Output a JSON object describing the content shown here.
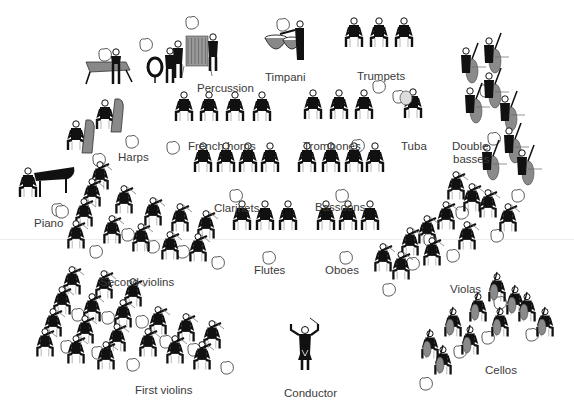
{
  "colors": {
    "figure": "#111111",
    "instrument_gray": "#8a8a8a",
    "label": "#3a3a3a",
    "background": "#ffffff",
    "outline": "#333333"
  },
  "sections": [
    {
      "id": "percussion",
      "label": "Percussion",
      "x": 197,
      "y": 82,
      "players": [
        {
          "x": 108,
          "y": 58,
          "kind": "xylophone"
        },
        {
          "x": 148,
          "y": 43,
          "kind": "bassdrum"
        },
        {
          "x": 178,
          "y": 44,
          "kind": "standing"
        },
        {
          "x": 190,
          "y": 36,
          "kind": "chimes"
        },
        {
          "x": 213,
          "y": 37,
          "kind": "standing"
        }
      ],
      "bubbles": [
        [
          105,
          55
        ],
        [
          146,
          45
        ],
        [
          192,
          23
        ]
      ]
    },
    {
      "id": "timpani",
      "label": "Timpani",
      "x": 265,
      "y": 71,
      "players": [
        {
          "x": 290,
          "y": 30,
          "kind": "timpani"
        }
      ],
      "bubbles": [
        [
          283,
          25
        ]
      ]
    },
    {
      "id": "trumpets",
      "label": "Trumpets",
      "x": 357,
      "y": 70,
      "players": [
        {
          "x": 354,
          "y": 35
        },
        {
          "x": 379,
          "y": 35
        },
        {
          "x": 404,
          "y": 35
        }
      ],
      "bubbles": [
        [
          379,
          87
        ]
      ]
    },
    {
      "id": "french_horns",
      "label": "French horns",
      "x": 188,
      "y": 140,
      "players": [
        {
          "x": 184,
          "y": 109
        },
        {
          "x": 209,
          "y": 109
        },
        {
          "x": 235,
          "y": 109
        },
        {
          "x": 262,
          "y": 109
        }
      ],
      "bubbles": [
        [
          173,
          148
        ]
      ]
    },
    {
      "id": "harps",
      "label": "Harps",
      "x": 118,
      "y": 151,
      "players": [
        {
          "x": 82,
          "y": 128,
          "kind": "harp"
        },
        {
          "x": 111,
          "y": 107,
          "kind": "harp"
        }
      ],
      "bubbles": [
        [
          99,
          160
        ],
        [
          132,
          142
        ]
      ]
    },
    {
      "id": "trombones",
      "label": "Trombones",
      "x": 303,
      "y": 140,
      "players": [
        {
          "x": 313,
          "y": 107
        },
        {
          "x": 339,
          "y": 107
        },
        {
          "x": 364,
          "y": 107
        }
      ],
      "bubbles": [
        [
          358,
          146
        ]
      ]
    },
    {
      "id": "tuba",
      "label": "Tuba",
      "x": 401,
      "y": 140,
      "players": [
        {
          "x": 413,
          "y": 106,
          "kind": "tuba"
        }
      ],
      "bubbles": [
        [
          399,
          97
        ]
      ]
    },
    {
      "id": "double_basses",
      "label_line1": "Double",
      "label_line2": "basses",
      "x": 452,
      "y": 140,
      "players": [
        {
          "x": 474,
          "y": 65,
          "kind": "bass"
        },
        {
          "x": 497,
          "y": 55,
          "kind": "bass"
        },
        {
          "x": 497,
          "y": 90,
          "kind": "bass"
        },
        {
          "x": 478,
          "y": 105,
          "kind": "bass"
        },
        {
          "x": 513,
          "y": 113,
          "kind": "bass"
        },
        {
          "x": 517,
          "y": 145,
          "kind": "bass"
        },
        {
          "x": 495,
          "y": 162,
          "kind": "bass"
        },
        {
          "x": 530,
          "y": 167,
          "kind": "bass"
        }
      ],
      "bubbles": [
        [
          486,
          91
        ],
        [
          494,
          139
        ],
        [
          518,
          196
        ]
      ]
    },
    {
      "id": "clarinets",
      "label": "Clarinets",
      "x": 214,
      "y": 202,
      "players": [
        {
          "x": 203,
          "y": 160
        },
        {
          "x": 226,
          "y": 160
        },
        {
          "x": 248,
          "y": 160
        },
        {
          "x": 270,
          "y": 160
        }
      ],
      "bubbles": [
        [
          236,
          196
        ]
      ]
    },
    {
      "id": "bassoons",
      "label": "Bassoons",
      "x": 315,
      "y": 201,
      "players": [
        {
          "x": 307,
          "y": 160
        },
        {
          "x": 331,
          "y": 160
        },
        {
          "x": 354,
          "y": 160
        },
        {
          "x": 375,
          "y": 160
        }
      ],
      "bubbles": [
        [
          342,
          196
        ]
      ]
    },
    {
      "id": "piano",
      "label": "Piano",
      "x": 34,
      "y": 217,
      "players": [
        {
          "x": 28,
          "y": 175,
          "kind": "piano"
        }
      ],
      "bubbles": [
        [
          58,
          210
        ]
      ]
    },
    {
      "id": "flutes",
      "label": "Flutes",
      "x": 254,
      "y": 264,
      "players": [
        {
          "x": 242,
          "y": 218
        },
        {
          "x": 265,
          "y": 218
        },
        {
          "x": 288,
          "y": 218
        }
      ],
      "bubbles": [
        [
          269,
          258
        ]
      ]
    },
    {
      "id": "oboes",
      "label": "Oboes",
      "x": 325,
      "y": 264,
      "players": [
        {
          "x": 326,
          "y": 218
        },
        {
          "x": 348,
          "y": 218
        },
        {
          "x": 370,
          "y": 218
        }
      ],
      "bubbles": [
        [
          346,
          258
        ]
      ]
    },
    {
      "id": "second_violins",
      "label": "Second violins",
      "x": 100,
      "y": 276,
      "players": [
        {
          "x": 100,
          "y": 178,
          "kind": "violin"
        },
        {
          "x": 92,
          "y": 195,
          "kind": "violin"
        },
        {
          "x": 124,
          "y": 202,
          "kind": "violin"
        },
        {
          "x": 84,
          "y": 215,
          "kind": "violin"
        },
        {
          "x": 153,
          "y": 214,
          "kind": "violin"
        },
        {
          "x": 180,
          "y": 220,
          "kind": "violin"
        },
        {
          "x": 76,
          "y": 237,
          "kind": "violin"
        },
        {
          "x": 112,
          "y": 232,
          "kind": "violin"
        },
        {
          "x": 141,
          "y": 240,
          "kind": "violin"
        },
        {
          "x": 170,
          "y": 248,
          "kind": "violin"
        },
        {
          "x": 206,
          "y": 227,
          "kind": "violin"
        },
        {
          "x": 198,
          "y": 250,
          "kind": "violin"
        }
      ],
      "bubbles": [
        [
          128,
          235
        ],
        [
          96,
          252
        ],
        [
          153,
          247
        ],
        [
          183,
          252
        ],
        [
          218,
          263
        ],
        [
          62,
          212
        ]
      ]
    },
    {
      "id": "violas",
      "label": "Violas",
      "x": 450,
      "y": 283,
      "players": [
        {
          "x": 456,
          "y": 188,
          "kind": "violin"
        },
        {
          "x": 472,
          "y": 200,
          "kind": "violin"
        },
        {
          "x": 488,
          "y": 206,
          "kind": "violin"
        },
        {
          "x": 508,
          "y": 220,
          "kind": "violin"
        },
        {
          "x": 446,
          "y": 218,
          "kind": "violin"
        },
        {
          "x": 427,
          "y": 232,
          "kind": "violin"
        },
        {
          "x": 467,
          "y": 238,
          "kind": "violin"
        },
        {
          "x": 410,
          "y": 244,
          "kind": "violin"
        },
        {
          "x": 432,
          "y": 254,
          "kind": "violin"
        },
        {
          "x": 383,
          "y": 260,
          "kind": "violin"
        },
        {
          "x": 401,
          "y": 268,
          "kind": "violin"
        }
      ],
      "bubbles": [
        [
          462,
          213
        ],
        [
          430,
          240
        ],
        [
          497,
          236
        ],
        [
          413,
          264
        ],
        [
          453,
          256
        ],
        [
          389,
          290
        ]
      ]
    },
    {
      "id": "cellos",
      "label": "Cellos",
      "x": 485,
      "y": 364,
      "players": [
        {
          "x": 497,
          "y": 290,
          "kind": "cello"
        },
        {
          "x": 515,
          "y": 303,
          "kind": "cello"
        },
        {
          "x": 478,
          "y": 310,
          "kind": "cello"
        },
        {
          "x": 527,
          "y": 310,
          "kind": "cello"
        },
        {
          "x": 545,
          "y": 325,
          "kind": "cello"
        },
        {
          "x": 453,
          "y": 325,
          "kind": "cello"
        },
        {
          "x": 500,
          "y": 325,
          "kind": "cello"
        },
        {
          "x": 470,
          "y": 343,
          "kind": "cello"
        },
        {
          "x": 430,
          "y": 347,
          "kind": "cello"
        },
        {
          "x": 443,
          "y": 363,
          "kind": "cello"
        }
      ],
      "bubbles": [
        [
          500,
          303
        ],
        [
          488,
          338
        ],
        [
          532,
          335
        ],
        [
          460,
          352
        ],
        [
          426,
          384
        ]
      ]
    },
    {
      "id": "first_violins",
      "label": "First violins",
      "x": 135,
      "y": 384,
      "players": [
        {
          "x": 72,
          "y": 283,
          "kind": "violin"
        },
        {
          "x": 104,
          "y": 287,
          "kind": "violin"
        },
        {
          "x": 133,
          "y": 295,
          "kind": "violin"
        },
        {
          "x": 62,
          "y": 303,
          "kind": "violin"
        },
        {
          "x": 92,
          "y": 310,
          "kind": "violin"
        },
        {
          "x": 123,
          "y": 316,
          "kind": "violin"
        },
        {
          "x": 53,
          "y": 325,
          "kind": "violin"
        },
        {
          "x": 85,
          "y": 332,
          "kind": "violin"
        },
        {
          "x": 117,
          "y": 340,
          "kind": "violin"
        },
        {
          "x": 158,
          "y": 323,
          "kind": "violin"
        },
        {
          "x": 186,
          "y": 330,
          "kind": "violin"
        },
        {
          "x": 212,
          "y": 337,
          "kind": "violin"
        },
        {
          "x": 45,
          "y": 345,
          "kind": "violin"
        },
        {
          "x": 76,
          "y": 352,
          "kind": "violin"
        },
        {
          "x": 106,
          "y": 358,
          "kind": "violin"
        },
        {
          "x": 148,
          "y": 345,
          "kind": "violin"
        },
        {
          "x": 175,
          "y": 352,
          "kind": "violin"
        },
        {
          "x": 202,
          "y": 358,
          "kind": "violin"
        }
      ],
      "bubbles": [
        [
          78,
          315
        ],
        [
          108,
          318
        ],
        [
          142,
          322
        ],
        [
          67,
          347
        ],
        [
          98,
          353
        ],
        [
          166,
          342
        ],
        [
          194,
          350
        ],
        [
          133,
          365
        ],
        [
          227,
          368
        ]
      ]
    },
    {
      "id": "conductor",
      "label": "Conductor",
      "x": 284,
      "y": 387,
      "players": [
        {
          "x": 305,
          "y": 340,
          "kind": "conductor"
        }
      ],
      "bubbles": []
    }
  ]
}
